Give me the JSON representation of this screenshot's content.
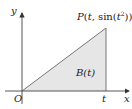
{
  "diagram": {
    "axes": {
      "x_label": "x",
      "y_label": "y",
      "origin_label": "O"
    },
    "point": {
      "label_P": "P",
      "label_open": "(",
      "label_t": "t",
      "label_comma": ", sin(",
      "label_t2": "t",
      "label_sup": "2",
      "label_close": "))"
    },
    "region_label": "B(t)",
    "t_tick_label": "t",
    "colors": {
      "axis": "#444444",
      "fill": "#e6e6e6",
      "edge": "#777777"
    }
  }
}
